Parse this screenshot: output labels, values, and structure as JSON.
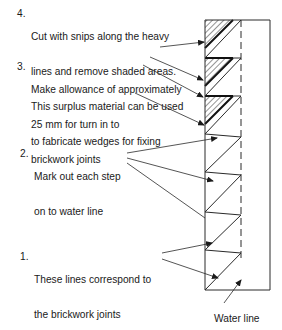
{
  "diagram": {
    "type": "construction-detail",
    "annotations": [
      {
        "number": "4.",
        "lines": [
          "Cut with snips along the heavy",
          "lines and remove shaded areas.",
          "This surplus material can be used",
          "to fabricate wedges for fixing"
        ]
      },
      {
        "number": "3.",
        "lines": [
          "Make allowance of approximately",
          "25 mm for turn in to",
          "brickwork joints"
        ]
      },
      {
        "number": "2.",
        "lines": [
          "Mark out each step",
          "on to water line"
        ]
      },
      {
        "number": "1.",
        "lines": [
          "These lines correspond to",
          "the brickwork joints"
        ]
      }
    ],
    "water_line_label": "Water line",
    "colors": {
      "line": "#2a2a2a",
      "text": "#1a1a1a",
      "background": "#ffffff"
    }
  }
}
